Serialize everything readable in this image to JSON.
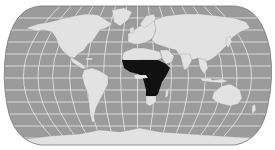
{
  "map": {
    "projection": "robinson",
    "colors": {
      "background": "#ffffff",
      "ocean": "#9b9b9b",
      "land": "#e2e2e2",
      "highlight": "#111111",
      "graticule": "#f4f4f4",
      "outline": "#7a7a7a"
    },
    "highlighted_region": "Sub-Saharan Africa",
    "regions": [
      {
        "name": "north-america"
      },
      {
        "name": "greenland"
      },
      {
        "name": "central-america"
      },
      {
        "name": "south-america"
      },
      {
        "name": "europe"
      },
      {
        "name": "asia"
      },
      {
        "name": "north-africa"
      },
      {
        "name": "sub-saharan-africa",
        "highlighted": true
      },
      {
        "name": "madagascar"
      },
      {
        "name": "arabia"
      },
      {
        "name": "india"
      },
      {
        "name": "southeast-asia"
      },
      {
        "name": "japan"
      },
      {
        "name": "australia"
      },
      {
        "name": "new-zealand"
      },
      {
        "name": "antarctica"
      }
    ]
  }
}
